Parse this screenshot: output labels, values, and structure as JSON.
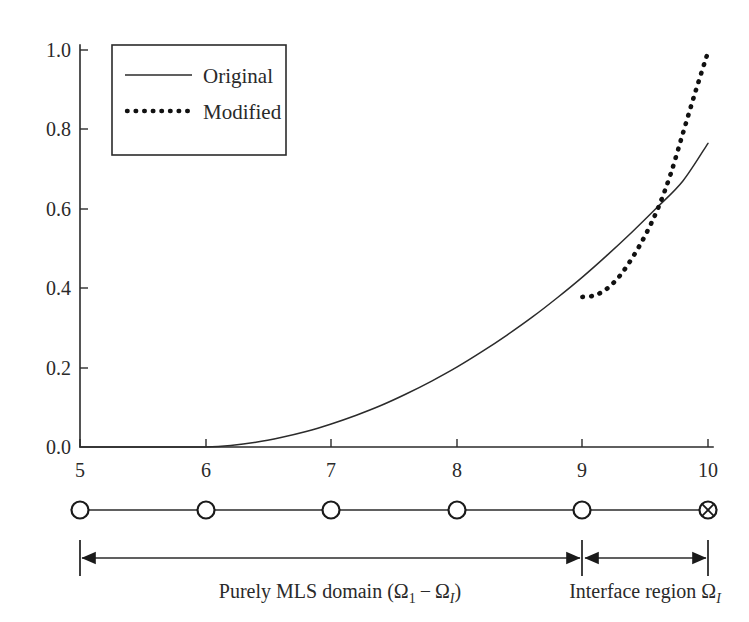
{
  "chart_data": {
    "type": "line",
    "title": "",
    "xlabel": "",
    "ylabel": "",
    "xlim": [
      5,
      10
    ],
    "ylim": [
      0.0,
      1.0
    ],
    "grid": false,
    "legend_position": "upper-left",
    "x_ticks": [
      "5",
      "6",
      "7",
      "8",
      "9",
      "10"
    ],
    "y_ticks": [
      "0.0",
      "0.2",
      "0.4",
      "0.6",
      "0.8",
      "1.0"
    ],
    "series": [
      {
        "name": "Original",
        "style": "solid",
        "x": [
          5.0,
          5.2,
          5.4,
          5.6,
          5.8,
          6.0,
          6.2,
          6.4,
          6.6,
          6.8,
          7.0,
          7.2,
          7.4,
          7.6,
          7.8,
          8.0,
          8.2,
          8.4,
          8.6,
          8.8,
          9.0,
          9.2,
          9.4,
          9.6,
          9.8,
          10.0
        ],
        "values": [
          0.0,
          0.0,
          0.0,
          0.0,
          0.0,
          0.0,
          0.004,
          0.012,
          0.024,
          0.039,
          0.058,
          0.08,
          0.105,
          0.134,
          0.166,
          0.201,
          0.24,
          0.282,
          0.327,
          0.376,
          0.428,
          0.484,
          0.543,
          0.605,
          0.67,
          0.765
        ]
      },
      {
        "name": "Modified",
        "style": "dotted",
        "x": [
          9.0,
          9.1,
          9.2,
          9.3,
          9.4,
          9.5,
          9.6,
          9.7,
          9.8,
          9.9,
          10.0
        ],
        "values": [
          0.378,
          0.382,
          0.4,
          0.432,
          0.478,
          0.533,
          0.6,
          0.685,
          0.79,
          0.895,
          0.995
        ]
      }
    ],
    "legend_entries": [
      "Original",
      "Modified"
    ],
    "annotations": {
      "branch_point_x": 9.0,
      "crossing_point_x": 9.5
    }
  },
  "legend": {
    "original_label": "Original",
    "modified_label": "Modified"
  },
  "axis": {
    "y_tick_labels": [
      "1.0",
      "0.8",
      "0.6",
      "0.4",
      "0.2",
      "0.0"
    ],
    "x_tick_labels": [
      "5",
      "6",
      "7",
      "8",
      "9",
      "10"
    ]
  },
  "node_diagram": {
    "node_positions": [
      "5",
      "6",
      "7",
      "8",
      "9",
      "10"
    ],
    "node_markers": [
      "circle",
      "circle",
      "circle",
      "circle",
      "circle",
      "circle-cross"
    ]
  },
  "spans": {
    "left": {
      "text_main": "Purely MLS domain (Ω",
      "text_sub_1": "1",
      "text_mid": " − Ω",
      "text_sub_2": "I",
      "text_close": ")",
      "from": "5",
      "to": "9"
    },
    "right": {
      "text_main": "Interface region Ω",
      "text_sub": "I",
      "from": "9",
      "to": "10"
    }
  },
  "colors": {
    "ink": "#2b2b2b",
    "background": "#ffffff",
    "curve_original": "#2b2b2b",
    "curve_modified": "#111111"
  }
}
